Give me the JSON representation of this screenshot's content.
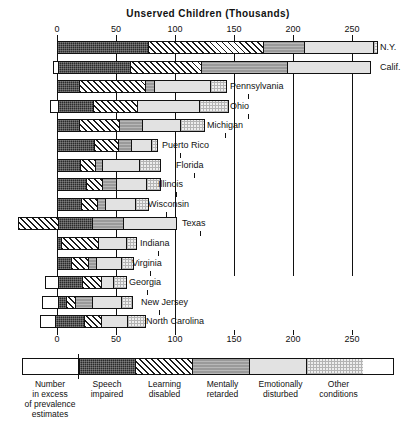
{
  "chart_data": {
    "type": "bar",
    "subtype": "horizontal-stacked",
    "title": "Unserved Children (Thousands)",
    "xlabel": "Unserved Children (Thousands)",
    "ylabel": "",
    "xlim": [
      -40,
      265
    ],
    "xticks": [
      0,
      50,
      100,
      150,
      200,
      250
    ],
    "xtick_labels": [
      "0",
      "50",
      "100",
      "150",
      "200",
      "250"
    ],
    "grid": true,
    "grid_axis": "x",
    "legend_position": "bottom",
    "series": [
      {
        "name": "Number in excess of prevalence estimates",
        "key": "excess"
      },
      {
        "name": "Speech impaired",
        "key": "speech"
      },
      {
        "name": "Learning disabled",
        "key": "learning"
      },
      {
        "name": "Mentally retarded",
        "key": "mental"
      },
      {
        "name": "Emotionally disturbed",
        "key": "emotional"
      },
      {
        "name": "Other conditions",
        "key": "other"
      }
    ],
    "categories": [
      "N.Y.",
      "Calif.",
      "Pennsylvania",
      "Ohio",
      "Michigan",
      "Puerto Rico",
      "Florida",
      "Illinois",
      "Wisconsin",
      "Texas",
      "Indiana",
      "Virginia",
      "Georgia",
      "New Jersey",
      "North Carolina"
    ],
    "rows": [
      {
        "label": "N.Y.",
        "excess": 0,
        "speech": 77,
        "learning": 98,
        "mental": 35,
        "emotional": 59,
        "other": 3
      },
      {
        "label": "Calif.",
        "excess": -3,
        "speech": 61,
        "learning": 61,
        "mental": 73,
        "emotional": 71,
        "other": 0
      },
      {
        "label": "Pennsylvania",
        "excess": 0,
        "speech": 18,
        "learning": 57,
        "mental": 7,
        "emotional": 48,
        "other": 14
      },
      {
        "label": "Ohio",
        "excess": -6,
        "speech": 30,
        "learning": 38,
        "mental": 0,
        "emotional": 53,
        "other": 25
      },
      {
        "label": "Michigan",
        "excess": 0,
        "speech": 18,
        "learning": 34,
        "mental": 20,
        "emotional": 33,
        "other": 20
      },
      {
        "label": "Puerto Rico",
        "excess": 0,
        "speech": 31,
        "learning": 21,
        "mental": 11,
        "emotional": 17,
        "other": 6
      },
      {
        "label": "Florida",
        "excess": 0,
        "speech": 19,
        "learning": 13,
        "mental": 6,
        "emotional": 32,
        "other": 18
      },
      {
        "label": "Illinois",
        "excess": 0,
        "speech": 24,
        "learning": 14,
        "mental": 12,
        "emotional": 26,
        "other": 12
      },
      {
        "label": "Wisconsin",
        "excess": 0,
        "speech": 20,
        "learning": 14,
        "mental": 7,
        "emotional": 26,
        "other": 11
      },
      {
        "label": "Texas",
        "excess": -33,
        "speech": 30,
        "learning": 0,
        "mental": 26,
        "emotional": 46,
        "other": 0
      },
      {
        "label": "Indiana",
        "excess": 0,
        "speech": 3,
        "learning": 32,
        "mental": 0,
        "emotional": 24,
        "other": 9
      },
      {
        "label": "Virginia",
        "excess": 0,
        "speech": 11,
        "learning": 15,
        "mental": 7,
        "emotional": 22,
        "other": 10
      },
      {
        "label": "Georgia",
        "excess": -10,
        "speech": 21,
        "learning": 17,
        "mental": 0,
        "emotional": 10,
        "other": 11
      },
      {
        "label": "New Jersey",
        "excess": -13,
        "speech": 7,
        "learning": 8,
        "mental": 15,
        "emotional": 25,
        "other": 9
      },
      {
        "label": "North Carolina",
        "excess": -18,
        "speech": 0,
        "learning": 0,
        "mental": 0,
        "emotional": 0,
        "other": 0
      }
    ]
  },
  "legend": {
    "items": [
      {
        "key": "excess",
        "label_lines": "Number\nin excess\nof prevalence\nestimates"
      },
      {
        "key": "speech",
        "label_lines": "Speech\nimpaired"
      },
      {
        "key": "learning",
        "label_lines": "Learning\ndisabled"
      },
      {
        "key": "mental",
        "label_lines": "Mentally\nretarded"
      },
      {
        "key": "emotional",
        "label_lines": "Emotionally\ndisturbed"
      },
      {
        "key": "other",
        "label_lines": "Other\nconditions"
      }
    ]
  },
  "colors": {
    "speech": "#2a2a2a",
    "learning": "#ffffff",
    "mental": "#9a9a9a",
    "emotional": "#e2e2e2",
    "other": "#eeeeee",
    "excess": "#ffffff",
    "axis": "#111111"
  }
}
